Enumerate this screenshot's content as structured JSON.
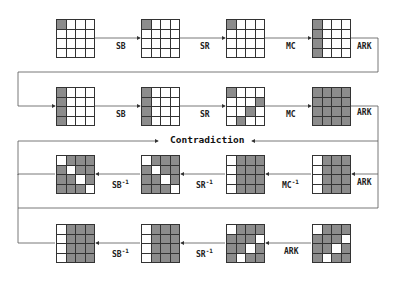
{
  "diagram": {
    "title": "",
    "contradiction_label": "Contradiction",
    "colors": {
      "active": "#8c8c8c",
      "inactive": "#ffffff",
      "line": "#555555"
    },
    "rows": [
      {
        "direction": "forward",
        "states": [
          {
            "active": [
              [
                0,
                0
              ]
            ]
          },
          {
            "active": [
              [
                0,
                0
              ]
            ]
          },
          {
            "active": [
              [
                0,
                0
              ]
            ]
          },
          {
            "active": [
              [
                0,
                0
              ],
              [
                1,
                0
              ],
              [
                2,
                0
              ],
              [
                3,
                0
              ]
            ]
          }
        ],
        "ops": [
          "SB",
          "SR",
          "MC"
        ],
        "end_op": "ARK"
      },
      {
        "direction": "forward",
        "states": [
          {
            "active": [
              [
                0,
                0
              ],
              [
                1,
                0
              ],
              [
                2,
                0
              ],
              [
                3,
                0
              ]
            ]
          },
          {
            "active": [
              [
                0,
                0
              ],
              [
                1,
                0
              ],
              [
                2,
                0
              ],
              [
                3,
                0
              ]
            ]
          },
          {
            "active": [
              [
                0,
                0
              ],
              [
                1,
                3
              ],
              [
                2,
                2
              ],
              [
                3,
                1
              ]
            ]
          },
          {
            "active": "all"
          }
        ],
        "ops": [
          "SB",
          "SR",
          "MC"
        ],
        "end_op": "ARK"
      },
      {
        "direction": "backward",
        "states": [
          {
            "inactive": [
              [
                0,
                0
              ],
              [
                1,
                1
              ],
              [
                2,
                2
              ],
              [
                3,
                3
              ]
            ]
          },
          {
            "inactive": [
              [
                0,
                0
              ],
              [
                1,
                1
              ],
              [
                2,
                2
              ],
              [
                3,
                3
              ]
            ]
          },
          {
            "inactive": [
              [
                0,
                0
              ],
              [
                1,
                0
              ],
              [
                2,
                0
              ],
              [
                3,
                0
              ]
            ]
          },
          {
            "inactive": [
              [
                0,
                0
              ],
              [
                1,
                0
              ],
              [
                2,
                0
              ],
              [
                3,
                0
              ]
            ]
          }
        ],
        "ops": [
          "SB⁻¹",
          "SR⁻¹",
          "MC⁻¹"
        ],
        "end_op": "ARK"
      },
      {
        "direction": "backward",
        "states": [
          {
            "inactive": [
              [
                0,
                0
              ],
              [
                1,
                0
              ],
              [
                2,
                0
              ],
              [
                3,
                0
              ]
            ]
          },
          {
            "inactive": [
              [
                0,
                0
              ],
              [
                1,
                0
              ],
              [
                2,
                0
              ],
              [
                3,
                0
              ]
            ]
          },
          {
            "inactive": [
              [
                0,
                0
              ],
              [
                1,
                3
              ],
              [
                2,
                2
              ],
              [
                3,
                1
              ]
            ]
          },
          {
            "inactive": [
              [
                0,
                0
              ],
              [
                1,
                3
              ],
              [
                2,
                2
              ],
              [
                3,
                1
              ]
            ]
          }
        ],
        "ops": [
          "SB⁻¹",
          "SR⁻¹",
          "ARK"
        ],
        "end_op": ""
      }
    ],
    "labels": {
      "r1": {
        "sb": "SB",
        "sr": "SR",
        "mc": "MC",
        "ark": "ARK"
      },
      "r2": {
        "sb": "SB",
        "sr": "SR",
        "mc": "MC",
        "ark": "ARK"
      },
      "r3": {
        "sb": "SB",
        "sr": "SR",
        "mc": "MC",
        "ark": "ARK",
        "inv": "-1"
      },
      "r4": {
        "sb": "SB",
        "sr": "SR",
        "ark": "ARK",
        "inv": "-1"
      }
    }
  }
}
